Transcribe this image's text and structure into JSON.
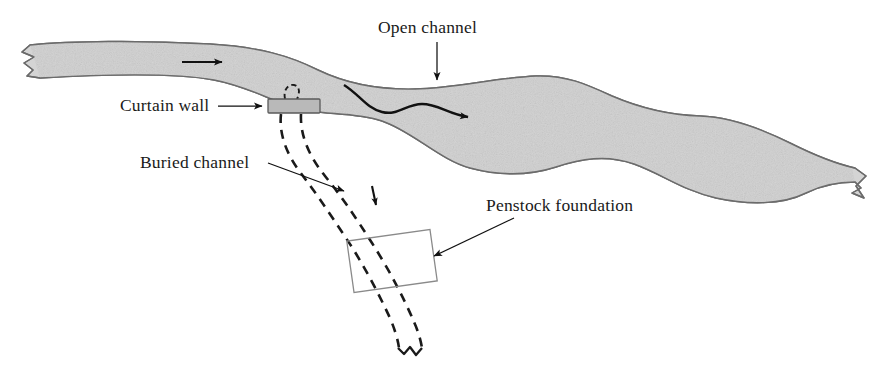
{
  "figure": {
    "kind": "engineering-site-plan",
    "background_color": "#ffffff",
    "width": 891,
    "height": 386
  },
  "labels": {
    "open_channel": "Open channel",
    "curtain_wall": "Curtain wall",
    "buried_channel": "Buried channel",
    "penstock_foundation": "Penstock foundation"
  },
  "colors": {
    "river_fill": "#d4d4d4",
    "river_outline": "#6b6b6b",
    "curtain_wall_fill": "#b9b9b9",
    "curtain_wall_stroke": "#5a5a5a",
    "penstock_stroke": "#8a8a8a",
    "ink": "#111111",
    "text": "#1a1a1a"
  },
  "label_positions": {
    "open_channel": {
      "x": 378,
      "y": 33
    },
    "curtain_wall": {
      "x": 120,
      "y": 111
    },
    "buried_channel": {
      "x": 140,
      "y": 168
    },
    "penstock_foundation": {
      "x": 486,
      "y": 211
    }
  },
  "elements": {
    "river": {
      "name": "open-channel-river",
      "description": "Wide speckled grey band running from upper-left to lower-right with ragged break edges at both ends"
    },
    "curtain_wall": {
      "name": "curtain-wall",
      "x": 268,
      "y": 99,
      "width": 52,
      "height": 14
    },
    "penstock_foundation": {
      "name": "penstock-foundation",
      "center_x": 392,
      "center_y": 261,
      "width": 84,
      "height": 52,
      "rotation_deg": -8
    },
    "flow_arrows": [
      {
        "name": "upstream-flow-arrow",
        "from_x": 182,
        "from_y": 62,
        "to_x": 228,
        "to_y": 62
      },
      {
        "name": "midstream-flow-arrow",
        "from_x": 345,
        "from_y": 84,
        "to_x": 478,
        "to_y": 118
      }
    ],
    "buried_channel_arrows": [
      {
        "name": "buried-channel-flow-arrow-upper"
      },
      {
        "name": "buried-channel-flow-arrow-lower"
      }
    ]
  },
  "leaders": {
    "open_channel": {
      "from_x": 437,
      "from_y": 42,
      "to_x": 437,
      "to_y": 84
    },
    "curtain_wall": {
      "from_x": 218,
      "from_y": 106,
      "to_x": 266,
      "to_y": 106
    },
    "buried_channel": {
      "from_x": 271,
      "from_y": 165,
      "to_x": 348,
      "to_y": 194
    },
    "penstock_foundation": {
      "from_x": 512,
      "from_y": 220,
      "to_x": 432,
      "to_y": 258
    }
  }
}
